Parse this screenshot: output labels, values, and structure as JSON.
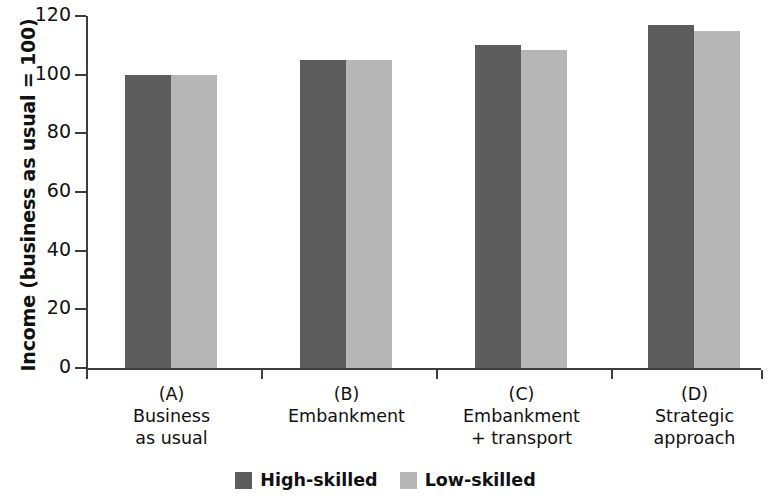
{
  "chart_data": {
    "type": "bar",
    "title": "",
    "xlabel": "",
    "ylabel": "Income (business as usual = 100)",
    "ylim": [
      0,
      120
    ],
    "yticks": [
      0,
      20,
      40,
      60,
      80,
      100,
      120
    ],
    "grid": false,
    "legend_position": "bottom-center",
    "categories": [
      {
        "code": "(A)",
        "name": "Business\nas usual",
        "name_line1": "Business",
        "name_line2": "as usual"
      },
      {
        "code": "(B)",
        "name": "Embankment",
        "name_line1": "Embankment",
        "name_line2": ""
      },
      {
        "code": "(C)",
        "name": "Embankment\n+ transport",
        "name_line1": "Embankment",
        "name_line2": "+ transport"
      },
      {
        "code": "(D)",
        "name": "Strategic\napproach",
        "name_line1": "Strategic",
        "name_line2": "approach"
      }
    ],
    "series": [
      {
        "name": "High-skilled",
        "color": "#5c5c5c",
        "values": [
          100,
          105,
          110,
          117
        ]
      },
      {
        "name": "Low-skilled",
        "color": "#b6b6b6",
        "values": [
          100,
          105,
          108.5,
          115
        ]
      }
    ]
  },
  "legend": {
    "items": [
      {
        "label": "High-skilled",
        "swatch": "high"
      },
      {
        "label": "Low-skilled",
        "swatch": "low"
      }
    ]
  },
  "axis": {
    "y_title": "Income (business as usual = 100)",
    "tick_labels": [
      "0",
      "20",
      "40",
      "60",
      "80",
      "100",
      "120"
    ]
  }
}
